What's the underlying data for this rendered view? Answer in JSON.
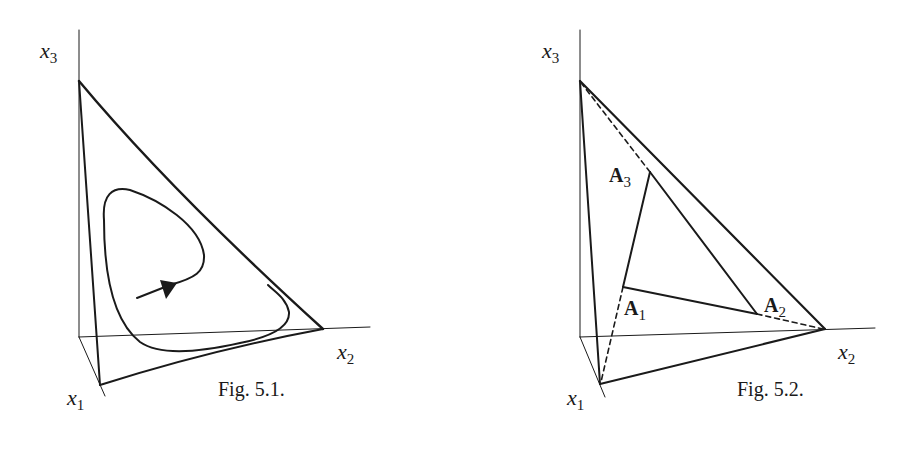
{
  "figures": [
    {
      "id": "fig-5-1",
      "caption": "Fig. 5.1.",
      "axes": {
        "x1": {
          "base": "x",
          "sub": "1"
        },
        "x2": {
          "base": "x",
          "sub": "2"
        },
        "x3": {
          "base": "x",
          "sub": "3"
        }
      },
      "description": "Simplex triangle in 3D coordinate frame with a closed orbit (cycle) inside and a direction arrow"
    },
    {
      "id": "fig-5-2",
      "caption": "Fig. 5.2.",
      "axes": {
        "x1": {
          "base": "x",
          "sub": "1"
        },
        "x2": {
          "base": "x",
          "sub": "2"
        },
        "x3": {
          "base": "x",
          "sub": "3"
        }
      },
      "points": [
        {
          "base": "A",
          "sub": "1"
        },
        {
          "base": "A",
          "sub": "2"
        },
        {
          "base": "A",
          "sub": "3"
        }
      ],
      "description": "Simplex triangle with inner triangle A1A2A3, dashed lines connecting inner vertices to simplex vertices"
    }
  ],
  "colors": {
    "ink": "#1a1a1a",
    "background": "#ffffff"
  }
}
